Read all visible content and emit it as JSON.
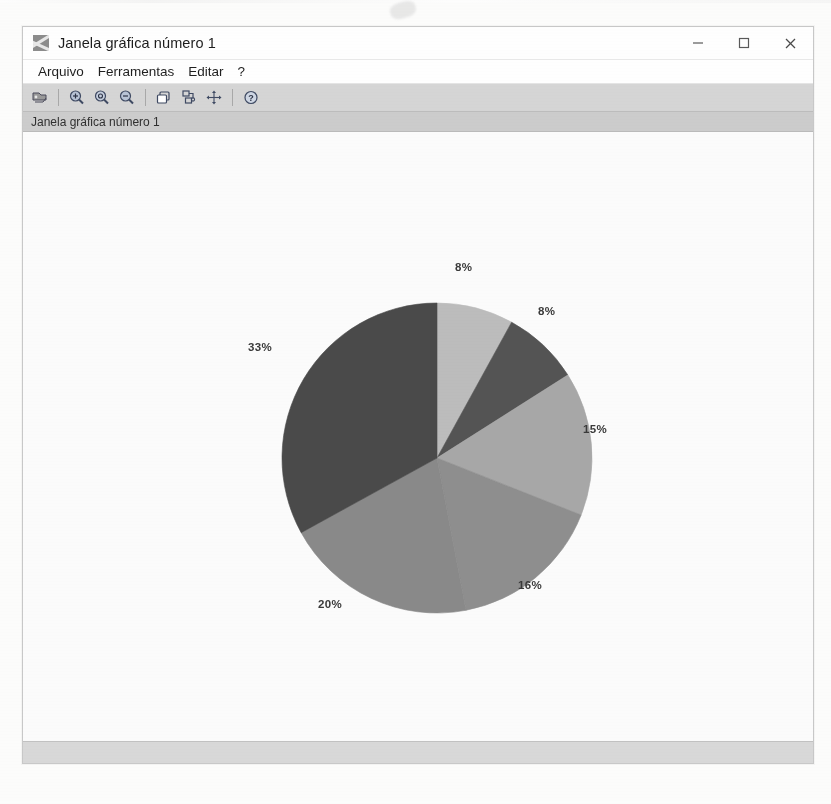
{
  "window": {
    "title": "Janela gráfica número 1",
    "app_icon": "scilab-graph-icon",
    "controls": [
      {
        "name": "minimize-button",
        "glyph": "minimize-icon"
      },
      {
        "name": "maximize-button",
        "glyph": "maximize-icon"
      },
      {
        "name": "close-button",
        "glyph": "close-icon"
      }
    ]
  },
  "menubar": {
    "items": [
      {
        "label": "Arquivo",
        "name": "menu-arquivo"
      },
      {
        "label": "Ferramentas",
        "name": "menu-ferramentas"
      },
      {
        "label": "Editar",
        "name": "menu-editar"
      },
      {
        "label": "?",
        "name": "menu-help"
      }
    ]
  },
  "toolbar": {
    "buttons": [
      {
        "name": "export-image-button",
        "icon": "export-image-icon",
        "tooltip": ""
      },
      {
        "name": "zoom-in-button",
        "icon": "zoom-in-icon",
        "tooltip": ""
      },
      {
        "name": "zoom-original-button",
        "icon": "zoom-original-icon",
        "tooltip": ""
      },
      {
        "name": "zoom-out-button",
        "icon": "zoom-out-icon",
        "tooltip": ""
      },
      {
        "name": "copy-figure-button",
        "icon": "copy-figure-icon",
        "tooltip": ""
      },
      {
        "name": "rotate-button",
        "icon": "rotate-icon",
        "tooltip": ""
      },
      {
        "name": "pan-button",
        "icon": "pan-move-icon",
        "tooltip": ""
      },
      {
        "name": "help-button",
        "icon": "help-question-icon",
        "tooltip": ""
      }
    ]
  },
  "infostrip": {
    "label": "Janela gráfica número 1"
  },
  "statusbar": {
    "text": ""
  },
  "chart_data": {
    "type": "pie",
    "title": "",
    "categories": [
      "Fatia 1",
      "Fatia 2",
      "Fatia 3",
      "Fatia 4",
      "Fatia 5",
      "Fatia 6"
    ],
    "values": [
      8,
      8,
      15,
      16,
      20,
      33
    ],
    "labels": [
      "8%",
      "8%",
      "15%",
      "16%",
      "20%",
      "33%"
    ],
    "colors": [
      "#bdbdbd",
      "#545454",
      "#a8a8a8",
      "#8f8f8f",
      "#8a8a8a",
      "#4a4a4a"
    ],
    "start_angle_deg": 90,
    "direction": "clockwise",
    "legend": "none",
    "grid": false,
    "label_positions": [
      {
        "text": "8%",
        "x": 455,
        "y": 258
      },
      {
        "text": "8%",
        "x": 538,
        "y": 302
      },
      {
        "text": "15%",
        "x": 583,
        "y": 420
      },
      {
        "text": "16%",
        "x": 518,
        "y": 576
      },
      {
        "text": "20%",
        "x": 318,
        "y": 595
      },
      {
        "text": "33%",
        "x": 248,
        "y": 338
      }
    ],
    "center": {
      "x": 437,
      "y": 455
    },
    "radius": 155
  }
}
